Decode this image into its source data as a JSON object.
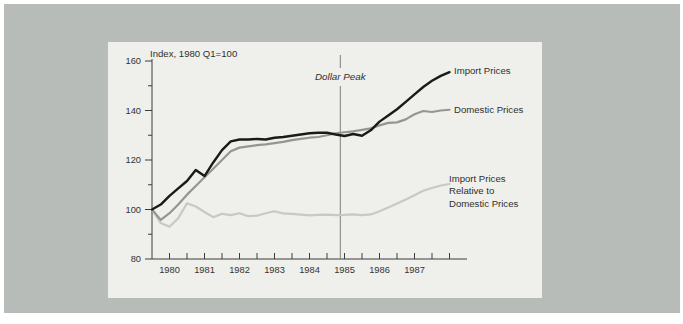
{
  "chart_data": {
    "type": "line",
    "index_note": "Index, 1980 Q1=100",
    "xlim": [
      1980,
      1989
    ],
    "ylim": [
      80,
      160
    ],
    "x_start": 1980,
    "x_step_years": 0.25,
    "y_ticks": [
      160,
      140,
      120,
      100,
      80
    ],
    "y_minor_ticks": [
      150,
      130,
      110,
      90
    ],
    "x_axis": {
      "tick_start": 1980.5,
      "tick_end": 1988.5,
      "tick_step": 0.5
    },
    "x_tick_years": [
      "1980",
      "1981",
      "1982",
      "1983",
      "1984",
      "1985",
      "1986",
      "1987"
    ],
    "annotation": {
      "label": "Dollar Peak",
      "x": 1985.38
    },
    "grid": "off",
    "legend_position": "right-of-lines",
    "series": [
      {
        "name": "Import Prices",
        "label_lines": [
          "Import Prices"
        ],
        "color": "#1a1a1a",
        "values": [
          100,
          102,
          105.5,
          108.5,
          111.5,
          116,
          113.5,
          119,
          124,
          127.5,
          128.3,
          128.3,
          128.5,
          128.3,
          129,
          129.3,
          129.8,
          130.3,
          130.8,
          131,
          131,
          130.3,
          129.7,
          130.5,
          129.8,
          132,
          135.5,
          138,
          140.5,
          143.5,
          146.5,
          149.5,
          152,
          154,
          155.5
        ]
      },
      {
        "name": "Domestic Prices",
        "label_lines": [
          "Domestic Prices"
        ],
        "color": "#949692",
        "values": [
          100,
          95.8,
          98.5,
          102,
          106,
          109.5,
          113,
          116.5,
          120,
          123.5,
          125,
          125.5,
          126,
          126.3,
          126.8,
          127.3,
          128,
          128.5,
          129,
          129.3,
          130,
          130.8,
          131.2,
          131.6,
          132.2,
          132.8,
          134,
          135,
          135.2,
          136.4,
          138.5,
          139.8,
          139.4,
          140,
          140.3
        ]
      },
      {
        "name": "Import Prices Relative to Domestic Prices",
        "label_lines": [
          "Import Prices",
          "Relative to",
          "Domestic Prices"
        ],
        "color": "#c7c9c5",
        "values": [
          100,
          94.5,
          93,
          96.5,
          102.5,
          101.2,
          99,
          96.9,
          98.3,
          97.7,
          98.5,
          97.3,
          97.5,
          98.5,
          99.3,
          98.4,
          98.2,
          97.9,
          97.6,
          97.8,
          97.9,
          97.7,
          97.8,
          98,
          97.7,
          98,
          99.3,
          100.8,
          102.4,
          104,
          105.8,
          107.6,
          108.7,
          109.7,
          110.3
        ]
      }
    ]
  }
}
